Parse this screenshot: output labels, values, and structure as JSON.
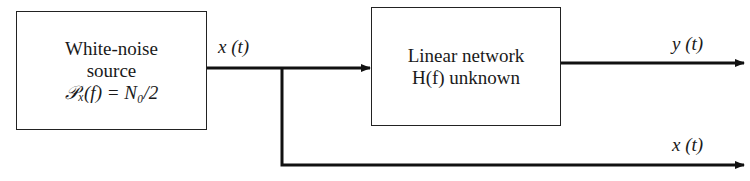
{
  "blocks": {
    "source": {
      "line1": "White-noise",
      "line2": "source",
      "line3": "𝒫ₓ(f) = N₀/2"
    },
    "network": {
      "line1": "Linear network",
      "line2": "H(f) unknown"
    }
  },
  "signals": {
    "input": "x (t)",
    "output": "y (t)",
    "reference": "x (t)"
  },
  "colors": {
    "stroke": "#111111",
    "background": "#ffffff"
  }
}
